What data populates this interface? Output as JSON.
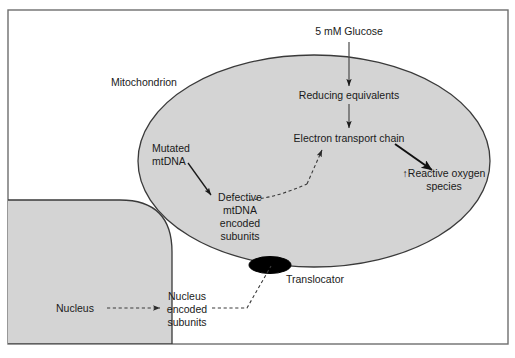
{
  "figure": {
    "frame": {
      "border_color": "#6e6e6e",
      "background": "#ffffff"
    },
    "colors": {
      "organelle_fill": "#d4d4d4",
      "organelle_stroke": "#3a3a3a",
      "translocator_fill": "#000000",
      "text": "#1a1a1a",
      "arrow_solid": "#1a1a1a",
      "arrow_dashed": "#4a4a4a"
    },
    "labels": {
      "glucose": "5 mM Glucose",
      "mitochondrion": "Mitochondrion",
      "reducing_equivalents": "Reducing equivalents",
      "electron_transport_chain": "Electron transport chain",
      "reactive_oxygen_species_line1": "↑Reactive oxygen",
      "reactive_oxygen_species_line2": "species",
      "mutated_mtdna_line1": "Mutated",
      "mutated_mtdna_line2": "mtDNA",
      "defective_line1": "Defective",
      "defective_line2": "mtDNA",
      "defective_line3": "encoded",
      "defective_line4": "subunits",
      "translocator": "Translocator",
      "nucleus": "Nucleus",
      "nucleus_encoded_line1": "Nucleus",
      "nucleus_encoded_line2": "encoded",
      "nucleus_encoded_line3": "subunits"
    },
    "shapes": {
      "mitochondrion_name": "mitochondrion-ellipse",
      "nucleus_name": "nucleus-shape",
      "translocator_name": "translocator-ellipse"
    },
    "connections": [
      {
        "name": "glucose-to-reducing-equivalents",
        "style": "solid-arrow"
      },
      {
        "name": "reducing-equivalents-to-etc",
        "style": "solid-arrow"
      },
      {
        "name": "etc-to-ros",
        "style": "solid-arrow-thick"
      },
      {
        "name": "mutated-mtdna-to-defective",
        "style": "solid-arrow"
      },
      {
        "name": "defective-subunits-to-etc",
        "style": "dashed-arrow"
      },
      {
        "name": "nucleus-to-nucleus-encoded-subunits",
        "style": "dashed-arrow"
      },
      {
        "name": "nucleus-encoded-subunits-to-translocator",
        "style": "dashed-line"
      }
    ]
  }
}
